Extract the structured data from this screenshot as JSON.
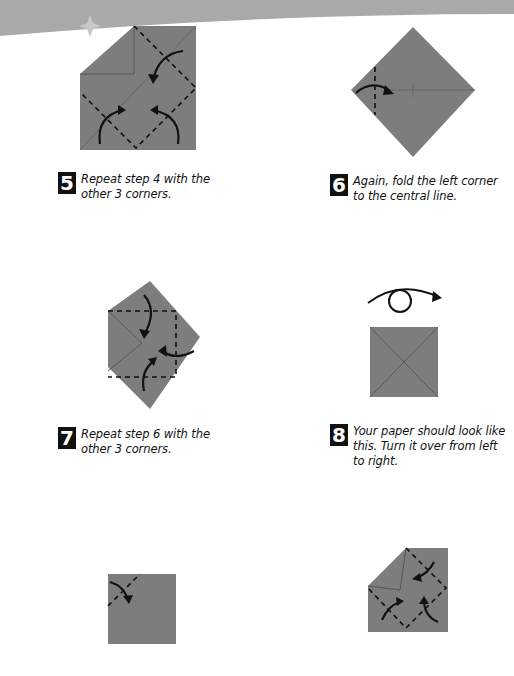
{
  "page": {
    "colors": {
      "paper": "#7d7d7d",
      "paper_dark": "#666666",
      "banner": "#a9a9a9",
      "ink": "#111111",
      "background": "#ffffff"
    }
  },
  "steps": [
    {
      "number": "5",
      "text": "Repeat step 4 with the other 3 corners."
    },
    {
      "number": "6",
      "text": "Again, fold the left corner to the central line."
    },
    {
      "number": "7",
      "text": "Repeat step 6 with the other 3 corners."
    },
    {
      "number": "8",
      "text": "Your paper should look like this. Turn it over from left to right."
    }
  ]
}
